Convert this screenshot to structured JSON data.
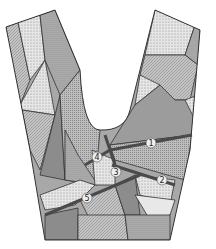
{
  "diagram": {
    "type": "patchwork-yoke",
    "seam_labels": [
      "1",
      "2",
      "3",
      "4",
      "5"
    ],
    "colors": {
      "outline": "#333333",
      "seam": "#4a4a4a",
      "fill_dark": "#8c8c8c",
      "fill_mid": "#a8a8a8",
      "fill_light": "#d4d4d4",
      "fill_pale": "#e8e8e8",
      "background": "#ffffff"
    }
  }
}
